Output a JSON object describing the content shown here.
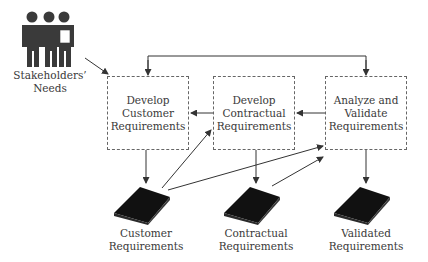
{
  "diagram": {
    "source": {
      "icon": "stakeholders-group-icon",
      "label_lines": [
        "Stakeholders’",
        "Needs"
      ]
    },
    "processes": [
      {
        "id": "develop-customer",
        "lines": [
          "Develop",
          "Customer",
          "Requirements"
        ]
      },
      {
        "id": "develop-contractual",
        "lines": [
          "Develop",
          "Contractual",
          "Requirements"
        ]
      },
      {
        "id": "analyze-validate",
        "lines": [
          "Analyze and",
          "Validate",
          "Requirements"
        ]
      }
    ],
    "artifacts": [
      {
        "id": "customer-reqs",
        "icon": "book-icon",
        "lines": [
          "Customer",
          "Requirements"
        ]
      },
      {
        "id": "contractual-reqs",
        "icon": "book-icon",
        "lines": [
          "Contractual",
          "Requirements"
        ]
      },
      {
        "id": "validated-reqs",
        "icon": "book-icon",
        "lines": [
          "Validated",
          "Requirements"
        ]
      }
    ],
    "connections": [
      {
        "from": "Stakeholders’ Needs",
        "to": "Develop Customer Requirements"
      },
      {
        "from": "Analyze and Validate Requirements",
        "to": "Develop Customer Requirements",
        "route": "top feedback"
      },
      {
        "from": "Analyze and Validate Requirements",
        "to": "Analyze and Validate Requirements",
        "route": "top feedback"
      },
      {
        "from": "Develop Contractual Requirements",
        "to": "Develop Customer Requirements"
      },
      {
        "from": "Analyze and Validate Requirements",
        "to": "Develop Contractual Requirements"
      },
      {
        "from": "Develop Customer Requirements",
        "to": "Customer Requirements"
      },
      {
        "from": "Develop Contractual Requirements",
        "to": "Contractual Requirements"
      },
      {
        "from": "Analyze and Validate Requirements",
        "to": "Validated Requirements"
      },
      {
        "from": "Customer Requirements",
        "to": "Develop Contractual Requirements"
      },
      {
        "from": "Customer Requirements",
        "to": "Analyze and Validate Requirements"
      },
      {
        "from": "Contractual Requirements",
        "to": "Analyze and Validate Requirements"
      }
    ],
    "colors": {
      "line": "#333333",
      "box_border": "#666666",
      "text": "#3a3a3a",
      "icon": "#1a1a1a"
    }
  }
}
